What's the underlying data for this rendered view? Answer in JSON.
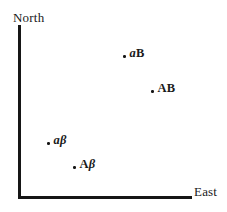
{
  "chart_data": {
    "type": "scatter",
    "title": "",
    "subtitle": "",
    "xlabel": "East",
    "ylabel": "North",
    "grid": false,
    "legend": null,
    "axis_style": "open-corner arrows omitted; two thick black rules meeting at lower-left origin",
    "xlim": [
      0,
      1
    ],
    "ylim": [
      0,
      1
    ],
    "categories": [
      "aB",
      "AB",
      "aβ",
      "Aβ"
    ],
    "points": [
      {
        "label": "aB",
        "label_parts": [
          {
            "text": "a",
            "style": "italic"
          },
          {
            "text": "B",
            "style": "roman"
          }
        ],
        "x": 0.63,
        "y": 0.83,
        "px": 127,
        "py": 54
      },
      {
        "label": "AB",
        "label_parts": [
          {
            "text": "A",
            "style": "roman"
          },
          {
            "text": "B",
            "style": "roman"
          }
        ],
        "x": 0.79,
        "y": 0.62,
        "px": 155,
        "py": 89
      },
      {
        "label": "aβ",
        "label_parts": [
          {
            "text": "a",
            "style": "italic"
          },
          {
            "text": "β",
            "style": "italic"
          }
        ],
        "x": 0.19,
        "y": 0.32,
        "px": 51,
        "py": 141
      },
      {
        "label": "Aβ",
        "label_parts": [
          {
            "text": "A",
            "style": "roman"
          },
          {
            "text": "β",
            "style": "italic"
          }
        ],
        "x": 0.34,
        "y": 0.18,
        "px": 77,
        "py": 165
      }
    ]
  },
  "axes": {
    "vertical_label": "North",
    "horizontal_label": "East"
  },
  "colors": {
    "background": "#ffffff",
    "axis": "#161616",
    "text": "#1a1a1a",
    "marker": "#161616"
  }
}
